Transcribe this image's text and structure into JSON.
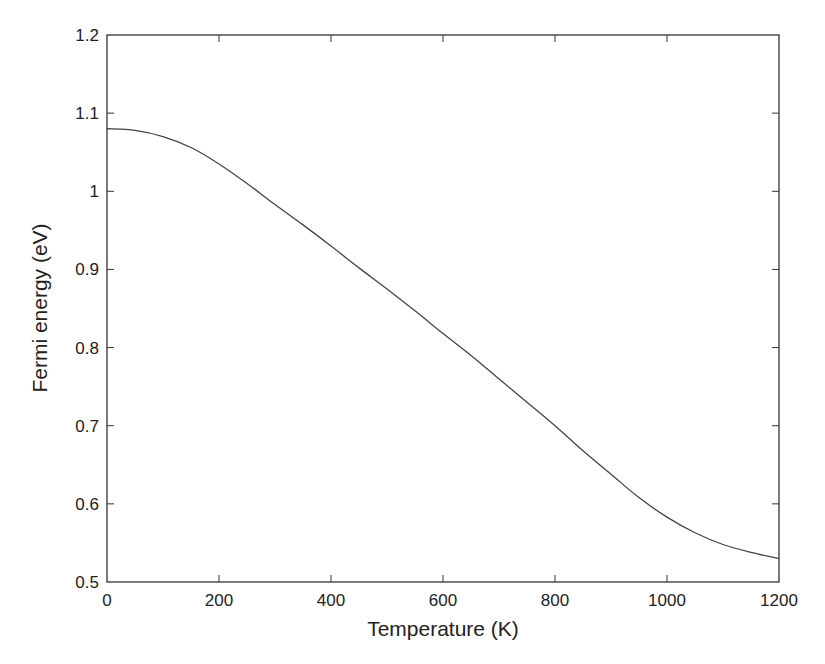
{
  "chart_data": {
    "type": "line",
    "title": "",
    "xlabel": "Temperature (K)",
    "ylabel": "Fermi energy (eV)",
    "xlim": [
      0,
      1200
    ],
    "ylim": [
      0.5,
      1.2
    ],
    "xticks": [
      0,
      200,
      400,
      600,
      800,
      1000,
      1200
    ],
    "xtick_labels": [
      "0",
      "200",
      "400",
      "600",
      "800",
      "1000",
      "1200"
    ],
    "yticks": [
      0.5,
      0.6,
      0.7,
      0.8,
      0.9,
      1.0,
      1.1,
      1.2
    ],
    "ytick_labels": [
      "0.5",
      "0.6",
      "0.7",
      "0.8",
      "0.9",
      "1",
      "1.1",
      "1.2"
    ],
    "grid": false,
    "legend": null,
    "series": [
      {
        "name": "Fermi energy",
        "color": "#444444",
        "x": [
          0,
          50,
          100,
          150,
          200,
          250,
          300,
          350,
          400,
          450,
          500,
          550,
          600,
          650,
          700,
          750,
          800,
          850,
          900,
          950,
          1000,
          1050,
          1100,
          1150,
          1200
        ],
        "y": [
          1.08,
          1.078,
          1.07,
          1.056,
          1.035,
          1.01,
          0.983,
          0.957,
          0.93,
          0.902,
          0.875,
          0.847,
          0.818,
          0.79,
          0.76,
          0.73,
          0.7,
          0.668,
          0.638,
          0.608,
          0.583,
          0.563,
          0.548,
          0.538,
          0.53
        ]
      }
    ]
  },
  "colors": {
    "axis": "#333333",
    "line": "#444444",
    "background": "#ffffff"
  }
}
